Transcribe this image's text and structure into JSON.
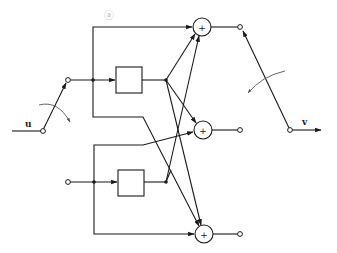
{
  "diagram": {
    "type": "block-diagram",
    "annotation": "ⓐ",
    "input_label": "u",
    "output_label": "v",
    "blocks": [
      {
        "id": "block-upper",
        "label": ""
      },
      {
        "id": "block-lower",
        "label": ""
      }
    ],
    "summers": [
      {
        "id": "summer-top",
        "symbol": "+"
      },
      {
        "id": "summer-middle",
        "symbol": "+"
      },
      {
        "id": "summer-bottom",
        "symbol": "+"
      }
    ],
    "input_switch": {
      "terminals": 2,
      "rotation_arrow": "clockwise"
    },
    "output_switch": {
      "terminals": 3,
      "rotation_arrow": "counter-clockwise"
    },
    "colors": {
      "line": "#1a1a1a",
      "background": "#ffffff",
      "annotation": "#bbbbbb"
    }
  }
}
